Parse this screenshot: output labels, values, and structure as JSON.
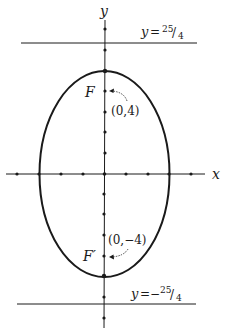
{
  "figure": {
    "type": "ellipse-with-directrices",
    "colors": {
      "ink": "#1a1a1a",
      "background": "#ffffff"
    },
    "axes": {
      "x_label": "x",
      "y_label": "y",
      "x_ticks": [
        -4,
        -3,
        -2,
        -1,
        0,
        1,
        2,
        3,
        4
      ],
      "y_ticks": [
        -7,
        -6,
        -5,
        -4,
        -3,
        -2,
        -1,
        0,
        1,
        2,
        3,
        4,
        5,
        6,
        7
      ]
    },
    "ellipse": {
      "center": [
        0,
        0
      ],
      "semi_axis_x": 3,
      "semi_axis_y": 5
    },
    "foci": [
      {
        "name": "F",
        "coords_label": "(0,4)",
        "x": 0,
        "y": 4
      },
      {
        "name": "F′",
        "coords_label": "(0,−4)",
        "x": 0,
        "y": -4
      }
    ],
    "directrices": [
      {
        "label_prefix": "y =",
        "label_value": "25/4",
        "num": "25",
        "den": "4",
        "sign": "",
        "y": 6.25
      },
      {
        "label_prefix": "y =",
        "label_value": "−25/4",
        "num": "25",
        "den": "4",
        "sign": "−",
        "y": -6.25
      }
    ]
  }
}
